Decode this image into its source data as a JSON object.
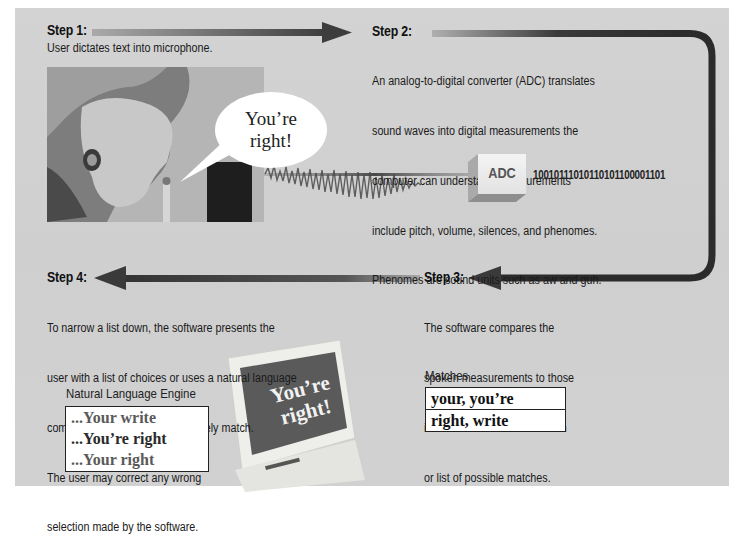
{
  "diagram": {
    "colors": {
      "panel_background": "#d1d1d1",
      "arrow_dark": "#2b2b2b",
      "arrow_light": "#9a9a9a",
      "text": "#1a1a1a",
      "box_border": "#222222"
    },
    "steps": [
      {
        "id": 1,
        "title": "Step 1:",
        "text": "User dictates text into microphone."
      },
      {
        "id": 2,
        "title": "Step 2:",
        "text_lines": [
          "An analog-to-digital converter (ADC) translates",
          "sound waves into digital measurements the",
          "computer can understand. Measurements",
          "include pitch, volume, silences, and phenomes.",
          "Phenomes are sound units such as aw and guh."
        ]
      },
      {
        "id": 3,
        "title": "Step 3:",
        "text_lines": [
          "The software compares the",
          "spoken measurements to those",
          "in its database to find a match",
          "or list of possible matches."
        ]
      },
      {
        "id": 4,
        "title": "Step 4:",
        "text_lines": [
          "To narrow a list down, the software presents the",
          "user with a list of choices or uses a natural language",
          "component to predict the most likely match.",
          "The user may correct any wrong",
          "selection made by the software."
        ]
      }
    ],
    "speech_bubble": {
      "line1": "You’re",
      "line2": "right!"
    },
    "adc": {
      "label": "ADC",
      "binary_output": "10010111010110101100001101"
    },
    "matches": {
      "label": "Matches",
      "rows": [
        "your, you’re",
        "right, write"
      ]
    },
    "natural_language_engine": {
      "label": "Natural Language Engine",
      "items": [
        {
          "text": "...Your write",
          "color": "#5a5a5a"
        },
        {
          "text": "...You’re right",
          "color": "#2a2a2a"
        },
        {
          "text": "...Your right",
          "color": "#5a5a5a"
        }
      ]
    },
    "monitor_screen": {
      "line1": "You’re",
      "line2": "right!"
    },
    "icons": {
      "microphone": "microphone-icon",
      "sound_wave": "sound-wave-icon",
      "monitor": "monitor-icon",
      "adc_cube": "adc-cube-icon"
    }
  }
}
